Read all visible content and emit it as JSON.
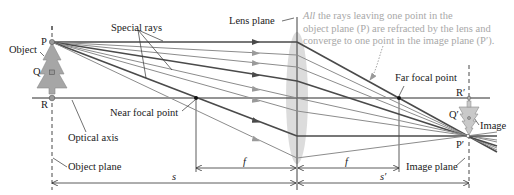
{
  "diagram": {
    "type": "thin-lens ray diagram",
    "labels": {
      "object": "Object",
      "point_p": "P",
      "point_q": "Q",
      "point_r": "R",
      "special_rays": "Special rays",
      "lens_plane": "Lens plane",
      "near_focal_point": "Near focal point",
      "far_focal_point": "Far focal point",
      "optical_axis": "Optical axis",
      "object_plane": "Object plane",
      "image_plane": "Image plane",
      "image": "Image",
      "point_p_prime": "P′",
      "point_q_prime": "Q′",
      "point_r_prime": "R′",
      "focal_length_left": "f",
      "focal_length_right": "f",
      "object_distance": "s",
      "image_distance": "s′"
    },
    "annotation": {
      "emphasis": "All",
      "line1_rest": " the rays leaving one point in the",
      "line2": "object plane (P) are refracted by the lens and",
      "line3": "converge to one point in the image plane (P′)."
    },
    "colors": {
      "special_ray": "#4a4a4a",
      "other_ray": "#8c8c8c",
      "lens": "#d9d9d9",
      "tree": "#a6a6a6",
      "annotation_text": "#a8a8a8",
      "axis": "#2b2b2b"
    },
    "geometry": {
      "object_x": 52,
      "lens_x": 297,
      "image_plane_x": 469,
      "optical_axis_y": 98,
      "near_focal_x": 196,
      "far_focal_x": 399,
      "p": [
        52,
        42
      ],
      "p_prime": [
        468,
        136
      ],
      "ray_lens_hits_y": [
        42,
        55,
        67,
        81,
        98,
        111,
        136,
        158
      ],
      "special_ray_indices": [
        0,
        3,
        6
      ]
    }
  }
}
